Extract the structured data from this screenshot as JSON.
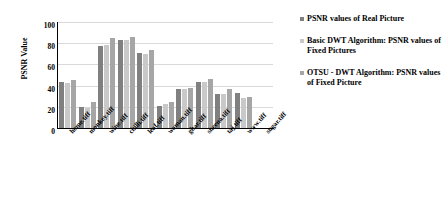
{
  "chart_data": {
    "type": "bar",
    "title": "",
    "xlabel": "",
    "ylabel": "PSNR Value",
    "ylim": [
      0,
      100
    ],
    "yticks": [
      0,
      20,
      40,
      60,
      80,
      100
    ],
    "grid": true,
    "legend_position": "right",
    "categories": [
      "home.tiff",
      "monkey.tiff",
      "wine.tiff",
      "chilli.tiff",
      "leaf.tiff",
      "woman.tiff",
      "ghar.tiff",
      "sheena.tiff",
      "taj.tiff",
      "www.tiff",
      "sugar.tiff"
    ],
    "series": [
      {
        "name": "PSNR values of Real Picture",
        "color": "#808080",
        "values": [
          43,
          20,
          77,
          83,
          71,
          21,
          37,
          43,
          32,
          33,
          0
        ]
      },
      {
        "name": "Basic DWT Algorithm: PSNR values of Fixed Pictures",
        "color": "#c9c9c9",
        "values": [
          42,
          19,
          78,
          83,
          70,
          23,
          37,
          43,
          32,
          28,
          0
        ]
      },
      {
        "name": "OTSU - DWT Algorithm: PSNR values of Fixed Picture",
        "color": "#a6a6a6",
        "values": [
          45,
          25,
          85,
          86,
          74,
          25,
          38,
          46,
          37,
          29,
          0
        ]
      }
    ]
  },
  "axes": {
    "y_title": "PSNR Value",
    "y_tick_labels": [
      "100",
      "80",
      "60",
      "40",
      "20",
      "0"
    ]
  },
  "legend": {
    "items": [
      {
        "marker": "square-swatch-icon",
        "label": "PSNR values of Real Picture"
      },
      {
        "marker": "square-swatch-icon",
        "label": "Basic DWT Algorithm: PSNR values of Fixed Pictures"
      },
      {
        "marker": "square-swatch-icon",
        "label": "OTSU - DWT Algorithm: PSNR values of Fixed Picture"
      }
    ]
  }
}
